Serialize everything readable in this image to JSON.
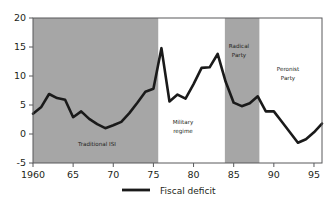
{
  "chart_data": {
    "type": "line",
    "title": "",
    "xlabel": "",
    "ylabel": "",
    "xlim": [
      1960,
      1996
    ],
    "ylim": [
      -5,
      20
    ],
    "grid": false,
    "legend_position": "bottom-center",
    "y_ticks": [
      20,
      15,
      10,
      5,
      0,
      -5
    ],
    "y_tick_labels": [
      "20",
      "15",
      "10",
      "5",
      "0",
      "-5"
    ],
    "x_ticks": [
      1960,
      1965,
      1970,
      1975,
      1980,
      1985,
      1990,
      1995
    ],
    "x_tick_labels": [
      "1960",
      "65",
      "70",
      "75",
      "80",
      "85",
      "90",
      "95"
    ],
    "series": [
      {
        "name": "Fiscal deficit",
        "color": "#1a1a1a",
        "x": [
          1960,
          1961,
          1962,
          1963,
          1964,
          1965,
          1966,
          1967,
          1968,
          1969,
          1970,
          1971,
          1972,
          1973,
          1974,
          1975,
          1976,
          1977,
          1978,
          1979,
          1980,
          1981,
          1982,
          1983,
          1984,
          1985,
          1986,
          1987,
          1988,
          1989,
          1990,
          1991,
          1992,
          1993,
          1994,
          1995,
          1996
        ],
        "values": [
          3.5,
          4.6,
          6.9,
          6.2,
          5.9,
          2.9,
          3.9,
          2.6,
          1.7,
          1.0,
          1.5,
          2.1,
          3.6,
          5.4,
          7.3,
          7.8,
          14.8,
          5.6,
          6.8,
          6.1,
          8.6,
          11.4,
          11.5,
          13.8,
          9.0,
          5.4,
          4.8,
          5.3,
          6.5,
          3.9,
          3.9,
          2.1,
          0.3,
          -1.5,
          -0.9,
          0.3,
          1.8
        ]
      }
    ],
    "bands": [
      {
        "label_line1": "Traditional ISI",
        "label_line2": "",
        "x_start": 1960,
        "x_end": 1975.6,
        "shaded": true
      },
      {
        "label_line1": "Military",
        "label_line2": "regime",
        "x_start": 1975.6,
        "x_end": 1983.9,
        "shaded": false
      },
      {
        "label_line1": "Radical",
        "label_line2": "Party",
        "x_start": 1983.9,
        "x_end": 1988.2,
        "shaded": true
      },
      {
        "label_line1": "Peronist",
        "label_line2": "Party",
        "x_start": 1988.2,
        "x_end": 1996,
        "shaded": false
      }
    ],
    "band_shade_color": "#a6a6a6"
  },
  "legend": {
    "entries": [
      {
        "label": "Fiscal deficit",
        "color": "#1a1a1a"
      }
    ]
  }
}
